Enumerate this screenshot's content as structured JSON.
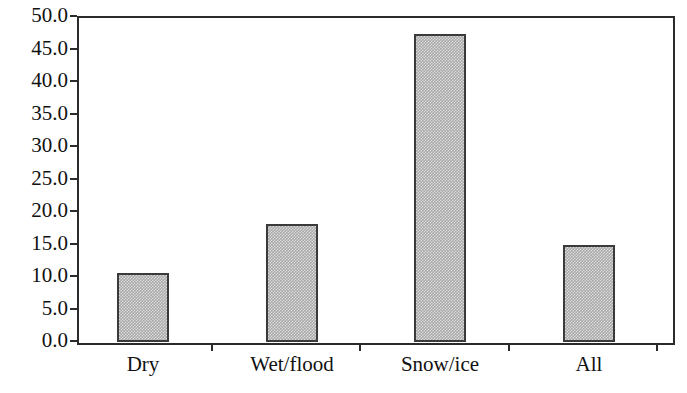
{
  "chart_data": {
    "type": "bar",
    "title": "",
    "subtitle": "",
    "xlabel": "",
    "ylabel": "",
    "categories": [
      "Dry",
      "Wet/flood",
      "Snow/ice",
      "All"
    ],
    "values": [
      10.5,
      18.0,
      47.2,
      14.7
    ],
    "ylim": [
      0.0,
      50.0
    ],
    "ytick_step": 5.0,
    "ytick_labels": [
      "0.0",
      "5.0",
      "10.0",
      "15.0",
      "20.0",
      "25.0",
      "30.0",
      "35.0",
      "40.0",
      "45.0",
      "50.0"
    ],
    "ytick_values": [
      0.0,
      5.0,
      10.0,
      15.0,
      20.0,
      25.0,
      30.0,
      35.0,
      40.0,
      45.0,
      50.0
    ],
    "grid": false,
    "legend": null,
    "legend_position": "none",
    "bar_fill_color": "#aaaaaa",
    "bar_edge_color": "#3a3a3a",
    "axis_color": "#2b2b2b",
    "background_color": "#ffffff",
    "annotations": []
  }
}
